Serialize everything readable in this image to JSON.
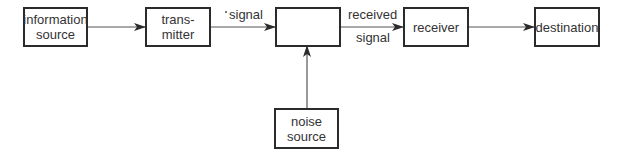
{
  "diagram": {
    "type": "block-diagram",
    "nodes": [
      {
        "id": "information-source",
        "lines": [
          "information",
          "source"
        ]
      },
      {
        "id": "transmitter",
        "lines": [
          "trans-",
          "mitter"
        ]
      },
      {
        "id": "channel",
        "lines": []
      },
      {
        "id": "receiver",
        "lines": [
          "receiver"
        ]
      },
      {
        "id": "destination",
        "lines": [
          "destination"
        ]
      },
      {
        "id": "noise-source",
        "lines": [
          "noise",
          "source"
        ]
      }
    ],
    "edges": [
      {
        "from": "information-source",
        "to": "transmitter",
        "label": ""
      },
      {
        "from": "transmitter",
        "to": "channel",
        "label": "signal"
      },
      {
        "from": "channel",
        "to": "receiver",
        "label_above": "received",
        "label_below": "signal"
      },
      {
        "from": "receiver",
        "to": "destination",
        "label": ""
      },
      {
        "from": "noise-source",
        "to": "channel",
        "label": ""
      }
    ],
    "colors": {
      "stroke": "#2b2b2b",
      "text": "#333333",
      "background": "#ffffff"
    }
  }
}
